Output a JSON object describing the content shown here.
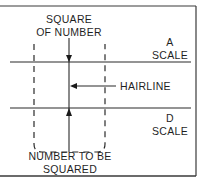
{
  "diagram": {
    "labels": {
      "square_of_number": [
        "SQUARE",
        "OF NUMBER"
      ],
      "a_scale": [
        "A",
        "SCALE"
      ],
      "hairline": "HAIRLINE",
      "d_scale": [
        "D",
        "SCALE"
      ],
      "number_to_be_squared": [
        "NUMBER TO BE",
        "SQUARED"
      ]
    },
    "elements": {
      "top_scale": "A SCALE line",
      "bottom_scale": "D SCALE line",
      "hairline": "vertical hairline",
      "reading_window": "dashed rounded box"
    },
    "colors": {
      "line": "#2a2a2a",
      "frame": "#333333",
      "background": "#ffffff"
    }
  }
}
